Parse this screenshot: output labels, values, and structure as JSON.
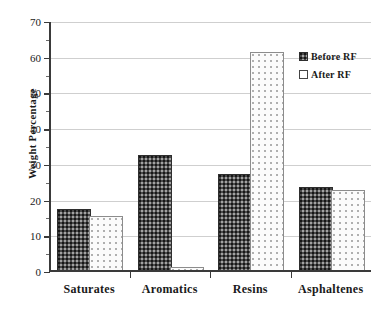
{
  "chart_data": {
    "type": "bar",
    "title": "",
    "subtitle": "",
    "xlabel": "",
    "ylabel": "Weight Percentage",
    "categories": [
      "Saturates",
      "Aromatics",
      "Resins",
      "Asphaltenes"
    ],
    "series": [
      {
        "name": "Before RF",
        "values": [
          17.2,
          32.3,
          27.0,
          23.3
        ]
      },
      {
        "name": "After RF",
        "values": [
          15.2,
          0.8,
          61.0,
          22.5
        ]
      }
    ],
    "ylim": [
      0,
      70
    ],
    "ytick_step": 10,
    "ytick_labels": [
      "0",
      "10",
      "20",
      "30",
      "40",
      "50",
      "60",
      "70"
    ],
    "yticks": [
      0,
      10,
      20,
      30,
      40,
      50,
      60,
      70
    ],
    "yticks_minor": [
      5,
      15,
      25,
      35,
      45,
      55,
      65
    ],
    "grid": true,
    "grid_axis": "y",
    "legend_position": "top-right",
    "legend": [
      {
        "label": "Before RF",
        "swatch": "dark-dotted-fill"
      },
      {
        "label": "After RF",
        "swatch": "white-open-fill"
      }
    ],
    "colors": {
      "before_fill": "#4a4a4a",
      "before_border": "#2e2e2e",
      "after_fill": "#fbfbfb",
      "after_border": "#8c8c8c",
      "gridline": "#cfcfcf",
      "axis": "#3a3a3a",
      "text": "#1a1a1a",
      "background": "#ffffff"
    }
  }
}
